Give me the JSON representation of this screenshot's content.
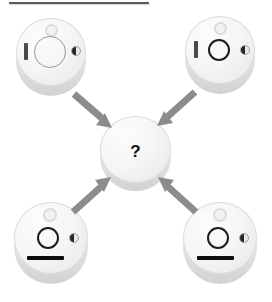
{
  "figure": {
    "type": "visual-analogy-puzzle",
    "title_rule_present": true,
    "background_color": "#ffffff",
    "arrow_color": "#8c8c8c",
    "disc_color": "#f2f2f2",
    "mark_color": "#1c1c1c"
  },
  "center": {
    "name": "unknown-answer-disc",
    "label": "?",
    "features": []
  },
  "objects": [
    {
      "id": "top-left",
      "name": "source-disc-top-left",
      "position": "top-left",
      "features": {
        "top_dot": "light-circle",
        "main_ring": "large-pale-ring",
        "left_bar": "vertical-bar",
        "bottom_bar": "none",
        "right_indicator": "half-filled-dot"
      }
    },
    {
      "id": "top-right",
      "name": "source-disc-top-right",
      "position": "top-right",
      "features": {
        "top_dot": "light-circle",
        "main_ring": "small-dark-ring",
        "left_bar": "vertical-bar",
        "bottom_bar": "none",
        "right_indicator": "half-filled-dot"
      }
    },
    {
      "id": "bottom-left",
      "name": "source-disc-bottom-left",
      "position": "bottom-left",
      "features": {
        "top_dot": "light-circle",
        "main_ring": "small-dark-ring",
        "left_bar": "none",
        "bottom_bar": "horizontal-black-bar",
        "right_indicator": "half-filled-dot"
      }
    },
    {
      "id": "bottom-right",
      "name": "source-disc-bottom-right",
      "position": "bottom-right",
      "features": {
        "top_dot": "light-circle",
        "main_ring": "small-dark-ring",
        "left_bar": "none",
        "bottom_bar": "horizontal-black-bar",
        "right_indicator": "half-filled-dot"
      }
    }
  ],
  "arrows": [
    {
      "id": "a1",
      "name": "arrow-top-left-to-center",
      "from": "top-left",
      "to": "center",
      "direction": "down-right"
    },
    {
      "id": "a2",
      "name": "arrow-top-right-to-center",
      "from": "top-right",
      "to": "center",
      "direction": "down-left"
    },
    {
      "id": "a3",
      "name": "arrow-bottom-left-to-center",
      "from": "bottom-left",
      "to": "center",
      "direction": "up-right"
    },
    {
      "id": "a4",
      "name": "arrow-bottom-right-to-center",
      "from": "bottom-right",
      "to": "center",
      "direction": "up-left"
    }
  ]
}
